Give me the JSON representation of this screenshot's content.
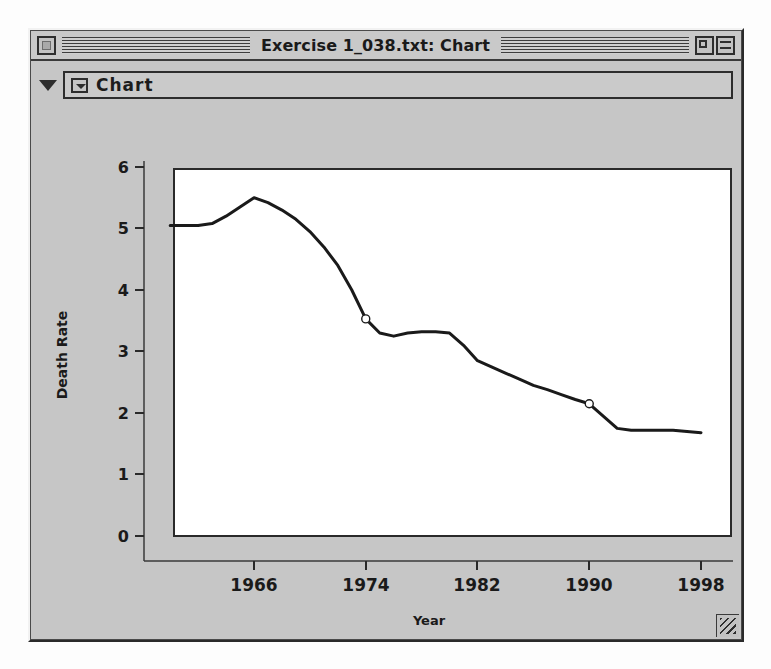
{
  "window": {
    "title": "Exercise 1_038.txt: Chart",
    "close_icon": "close-box-icon",
    "zoom_icon": "zoom-box-icon",
    "collapse_icon": "collapse-box-icon",
    "grow_icon": "resize-grip-icon"
  },
  "chart_header": {
    "disclosure_icon": "disclosure-triangle-icon",
    "popup_icon": "popup-menu-triangle-icon",
    "label": "Chart"
  },
  "colors": {
    "window_face": "#c6c6c6",
    "frame": "#2e2e2e",
    "plot_background": "#ffffff",
    "line": "#1a1a1a",
    "text": "#1a1a1a"
  },
  "chart_data": {
    "type": "line",
    "title": "",
    "xlabel": "Year",
    "ylabel": "Death Rate",
    "xlim": [
      1960,
      1999
    ],
    "ylim": [
      0,
      6.4
    ],
    "xticks": [
      1966,
      1974,
      1982,
      1990,
      1998
    ],
    "xtick_labels": [
      "1966",
      "1974",
      "1982",
      "1990",
      "1998"
    ],
    "yticks": [
      0,
      1,
      2,
      3,
      4,
      5,
      6
    ],
    "ytick_labels": [
      "0",
      "1",
      "2",
      "3",
      "4",
      "5",
      "6"
    ],
    "grid": false,
    "legend": null,
    "series": [
      {
        "name": "Death Rate",
        "x": [
          1960,
          1961,
          1962,
          1963,
          1964,
          1965,
          1966,
          1967,
          1968,
          1969,
          1970,
          1971,
          1972,
          1973,
          1974,
          1975,
          1976,
          1977,
          1978,
          1979,
          1980,
          1981,
          1982,
          1983,
          1984,
          1985,
          1986,
          1987,
          1988,
          1989,
          1990,
          1991,
          1992,
          1993,
          1994,
          1995,
          1996,
          1997,
          1998
        ],
        "y": [
          5.05,
          5.05,
          5.05,
          5.08,
          5.2,
          5.35,
          5.5,
          5.42,
          5.3,
          5.15,
          4.95,
          4.7,
          4.4,
          4.0,
          3.53,
          3.3,
          3.25,
          3.3,
          3.32,
          3.32,
          3.3,
          3.1,
          2.85,
          2.75,
          2.65,
          2.55,
          2.45,
          2.38,
          2.3,
          2.22,
          2.15,
          1.95,
          1.75,
          1.72,
          1.72,
          1.72,
          1.72,
          1.7,
          1.68
        ],
        "markers": [
          {
            "x": 1974,
            "y": 3.53,
            "style": "open-circle"
          },
          {
            "x": 1990,
            "y": 2.15,
            "style": "open-circle"
          }
        ]
      }
    ]
  }
}
